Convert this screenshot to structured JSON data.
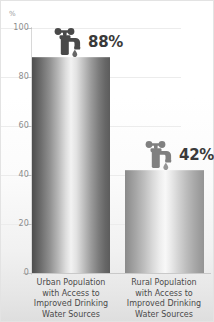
{
  "chart_data": {
    "type": "bar",
    "title": "",
    "xlabel": "",
    "ylabel": "%",
    "ylim": [
      0,
      100
    ],
    "grid": true,
    "legend": "none",
    "categories": [
      "Urban Population with Access to Improved Drinking Water Sources",
      "Rural Population with Access to Improved Drinking Water Sources"
    ],
    "values": [
      88,
      42
    ],
    "value_labels": [
      "88%",
      "42%"
    ],
    "yticks": [
      0,
      20,
      40,
      60,
      80,
      100
    ],
    "ytick_labels": [
      "0",
      "20",
      "40",
      "60",
      "80",
      "100"
    ],
    "annotations": [
      "faucet-icon above each bar with water drop"
    ]
  },
  "axis": {
    "unit_label": "%",
    "ticks": [
      {
        "value": 100,
        "label": "100"
      },
      {
        "value": 80,
        "label": "80"
      },
      {
        "value": 60,
        "label": "60"
      },
      {
        "value": 40,
        "label": "40"
      },
      {
        "value": 20,
        "label": "20"
      },
      {
        "value": 0,
        "label": "0"
      }
    ]
  },
  "bars": [
    {
      "key": "urban",
      "value_label": "88%",
      "label_lines": [
        "Urban Population",
        "with Access to",
        "Improved Drinking",
        "Water Sources"
      ]
    },
    {
      "key": "rural",
      "value_label": "42%",
      "label_lines": [
        "Rural Population",
        "with Access to",
        "Improved Drinking",
        "Water Sources"
      ]
    }
  ],
  "colors": {
    "bar_dark": "#4e4e4e",
    "bar_light": "#f2f2f2",
    "text": "#3a3a3a",
    "tick_text": "#8d8d8d",
    "gridline": "#ececec",
    "background": "#ffffff",
    "icon": "#4a4a4a"
  },
  "icons": {
    "faucet": "faucet-icon",
    "drop": "water-drop-icon"
  }
}
